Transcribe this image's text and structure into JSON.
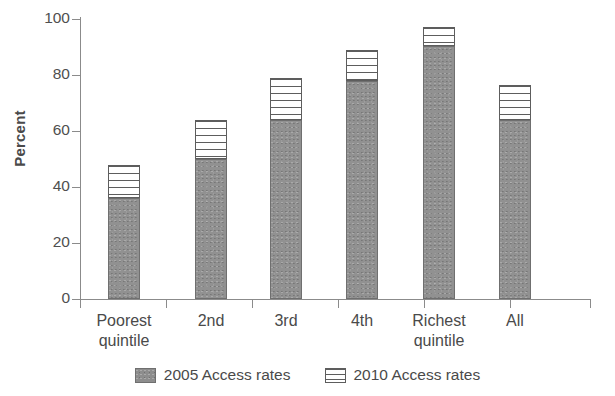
{
  "chart_data": {
    "type": "bar",
    "stacked": true,
    "title": "",
    "xlabel": "",
    "ylabel": "Percent",
    "ylim": [
      0,
      100
    ],
    "yticks": [
      0,
      20,
      40,
      60,
      80,
      100
    ],
    "grid": false,
    "legend_position": "bottom",
    "categories": [
      "Poorest quintile",
      "2nd",
      "3rd",
      "4th",
      "Richest quintile",
      "All"
    ],
    "category_lines": [
      [
        "Poorest",
        "quintile"
      ],
      [
        "2nd",
        ""
      ],
      [
        "3rd",
        ""
      ],
      [
        "4th",
        ""
      ],
      [
        "Richest",
        "quintile"
      ],
      [
        "All",
        ""
      ]
    ],
    "series": [
      {
        "name": "2005 Access rates",
        "pattern": "solid-gray",
        "color": "#919191",
        "values": [
          36,
          50,
          64,
          78,
          90.5,
          64
        ]
      },
      {
        "name": "2010 Access rates",
        "pattern": "horizontal-hatch",
        "color": "#ffffff",
        "values": [
          12,
          14,
          15,
          11,
          6.5,
          12.5
        ]
      }
    ],
    "totals": [
      48,
      64,
      79,
      89,
      97,
      76.5
    ]
  },
  "legend": {
    "items": [
      {
        "label": "2005 Access rates",
        "swatch": "solid-gray-swatch"
      },
      {
        "label": "2010 Access rates",
        "swatch": "hatched-swatch"
      }
    ]
  },
  "axes": {
    "y_label": "Percent",
    "y_tick_labels": [
      "100",
      "80",
      "60",
      "40",
      "20",
      "0"
    ]
  }
}
